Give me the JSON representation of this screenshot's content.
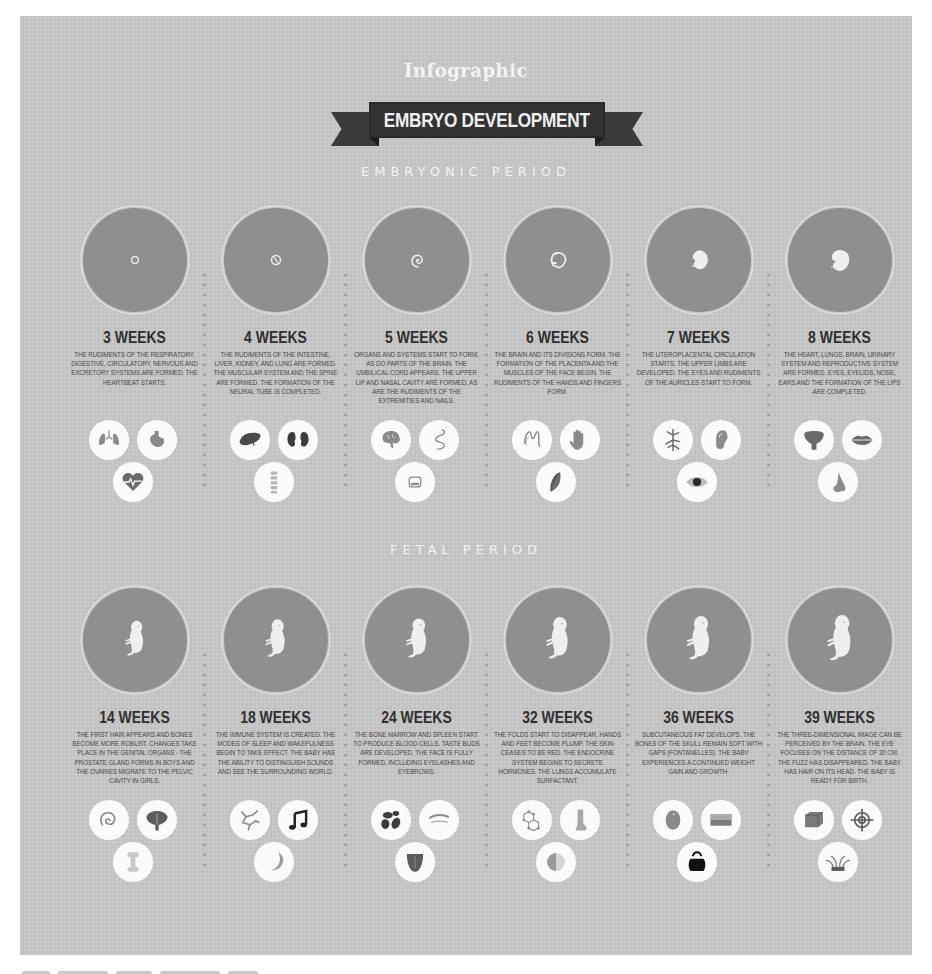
{
  "header": {
    "supertitle": "Infographic",
    "title": "EMBRYO DEVELOPMENT"
  },
  "colors": {
    "panel_background": "#c7c7c7",
    "disc": "#8f8f8f",
    "ribbon": "#333333",
    "icon_bubble": "#fbfbfb",
    "heading_text": "#f2f2f2",
    "week_text": "#2f2f2f",
    "body_text": "#4a4a4a"
  },
  "embryonic": {
    "heading": "EMBRYONIC PERIOD",
    "stages": [
      {
        "weeks": "3 WEEKS",
        "image": "embryo-3-weeks",
        "description": "The rudiments of the respiratory, digestive, circulatory, nervous and excretory systems are formed. The heartbeat starts.",
        "icons": [
          "lungs-icon",
          "stomach-icon",
          "heartbeat-icon"
        ]
      },
      {
        "weeks": "4 WEEKS",
        "image": "embryo-4-weeks",
        "description": "The rudiments of the intestine, liver, kidney, and lung are formed. The muscular system and the spine are formed. The formation of the neural tube is completed.",
        "icons": [
          "liver-icon",
          "kidneys-icon",
          "spine-icon"
        ]
      },
      {
        "weeks": "5 WEEKS",
        "image": "embryo-5-weeks",
        "description": "Organs and systems start to form, as do parts of the brain. The umbilical cord appears. The upper lip and nasal cavity are formed, as are the rudiments of the extremities and nails.",
        "icons": [
          "brain-icon",
          "umbilical-cord-icon",
          "fingernail-icon"
        ]
      },
      {
        "weeks": "6 WEEKS",
        "image": "embryo-6-weeks",
        "description": "The brain and its divisions form. The formation of the placenta and the muscles of the face begin. The rudiments of the hands and fingers form.",
        "icons": [
          "placenta-icon",
          "hand-icon",
          "muscle-icon"
        ]
      },
      {
        "weeks": "7 WEEKS",
        "image": "embryo-7-weeks",
        "description": "The uteroplacental circulation starts. The upper limbs are developed. The eyes and rudiments of the auricles start to form.",
        "icons": [
          "blood-vessels-icon",
          "ear-icon",
          "eye-icon"
        ]
      },
      {
        "weeks": "8 WEEKS",
        "image": "embryo-8-weeks",
        "description": "The heart, lungs, brain, urinary system and reproductive system are formed. Eyes, eyelids, nose, ears and the formation of the lips are completed.",
        "icons": [
          "bladder-icon",
          "lips-icon",
          "nose-icon"
        ]
      }
    ]
  },
  "fetal": {
    "heading": "FETAL PERIOD",
    "stages": [
      {
        "weeks": "14 WEEKS",
        "image": "fetus-14-weeks",
        "description": "The first hair appears and bones become more robust. Changes take place in the genital organs - the prostate gland forms in boys and the ovaries migrate to the pelvic cavity in girls.",
        "icons": [
          "hair-icon",
          "prostate-icon",
          "bone-icon"
        ]
      },
      {
        "weeks": "18 WEEKS",
        "image": "fetus-18-weeks",
        "description": "The immune system is created. The modes of sleep and wakefulness begin to take effect. The baby has the ability to distinguish sounds and see the surrounding world.",
        "icons": [
          "immune-cells-icon",
          "music-note-icon",
          "moon-icon"
        ]
      },
      {
        "weeks": "24 WEEKS",
        "image": "fetus-24-weeks",
        "description": "The bone marrow and spleen start to produce blood cells. Taste buds are developed. The face is fully formed, including eyelashes and eyebrows.",
        "icons": [
          "blood-cells-icon",
          "eyebrow-icon",
          "tongue-icon"
        ]
      },
      {
        "weeks": "32 WEEKS",
        "image": "fetus-32-weeks",
        "description": "The folds start to disappear. Hands and feet become plump. The skin ceases to be red. The endocrine system begins to secrete hormones. The lungs accumulate surfactant.",
        "icons": [
          "molecule-icon",
          "foot-icon",
          "skin-tone-icon"
        ]
      },
      {
        "weeks": "36 WEEKS",
        "image": "fetus-36-weeks",
        "description": "Subcutaneous fat develops. The bones of the skull remain soft with gaps (fontanelles). The baby experiences a continued weight gain and growth.",
        "icons": [
          "skull-icon",
          "fat-layer-icon",
          "weight-icon"
        ]
      },
      {
        "weeks": "39 WEEKS",
        "image": "fetus-39-weeks",
        "description": "The three-dimensional image can be perceived by the brain. The eye focuses on the distance of 30 cm. The fuzz has disappeared. The baby has hair on its head. The baby is ready for birth.",
        "icons": [
          "cube-icon",
          "target-icon",
          "scalp-hair-icon"
        ]
      }
    ]
  }
}
